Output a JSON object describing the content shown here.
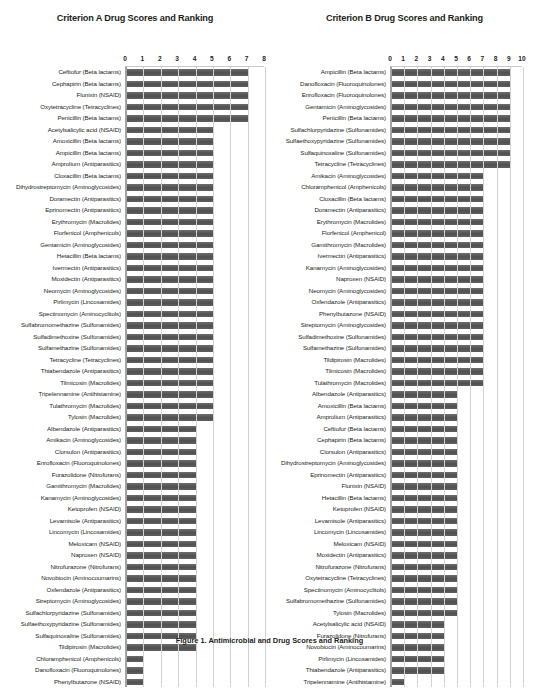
{
  "caption": "Figure 1. Antimicrobial and Drug Scores and Ranking",
  "charts": [
    {
      "id": "criterion-a",
      "chart_data": {
        "type": "bar",
        "orientation": "horizontal",
        "title": "Criterion A Drug Scores and Ranking",
        "xlabel": "",
        "ylabel": "",
        "xlim": [
          0,
          8
        ],
        "xticks": [
          0,
          1,
          2,
          3,
          4,
          5,
          6,
          7,
          8
        ],
        "grid": true,
        "legend": "none",
        "bar_color": "#595959",
        "categories": [
          "Ceftiofur (Beta lactams)",
          "Cephapirin (Beta lactams)",
          "Flunixin (NSAID)",
          "Oxytetracycline (Tetracyclines)",
          "Penicillin (Beta lactams)",
          "Acetylsalicylic acid (NSAID)",
          "Amoxicillin (Beta lactams)",
          "Ampicillin (Beta lactams)",
          "Amprolium (Antiparasitics)",
          "Cloxacillin (Beta lactams)",
          "Dihydrostreptomycin (Aminoglycosides)",
          "Doramectin (Antiparasitics)",
          "Eprinomectin (Antiparasitics)",
          "Erythromycin (Macrolides)",
          "Florfenicol (Amphenicols)",
          "Gentamicin (Aminoglycosides)",
          "Hetacillin (Beta lactams)",
          "Ivermectin (Antiparasitics)",
          "Moxidectin (Antiparasitics)",
          "Neomycin (Aminoglycosides)",
          "Pirlimycin (Lincosamides)",
          "Spectinomycin (Aminocyclitols)",
          "Sulfabromomethazine (Sulfonamides)",
          "Sulfadimethoxine (Sulfonamides)",
          "Sulfamethazine (Sulfonamides)",
          "Tetracycline (Tetracyclines)",
          "Thiabendazole (Antiparasitics)",
          "Tilmicosin (Macrolides)",
          "Tripelennamine (Antihistamine)",
          "Tulathromycin (Macrolides)",
          "Tylosin (Macrolides)",
          "Albendazole (Antiparasitics)",
          "Amikacin (Aminoglycosides)",
          "Clorsulon (Antiparasitics)",
          "Enrofloxacin (Fluoroquinolones)",
          "Furazolidone (Nitrofurans)",
          "Gamithromycin (Macrolides)",
          "Kanamycin (Aminoglycosides)",
          "Ketoprofen (NSAID)",
          "Levamisole (Antiparasitics)",
          "Lincomycin (Lincosamides)",
          "Meloxicam (NSAID)",
          "Naproxen (NSAID)",
          "Nitrofurazone (Nitrofurans)",
          "Novobiocin (Aminocoumarins)",
          "Oxfendazole (Antiparasitics)",
          "Streptomycin (Aminoglycosides)",
          "Sulfachlorpyridazine (Sulfonamides)",
          "Sulfaethoxypyridazine (Sulfonamides)",
          "Sulfaquinoxaline (Sulfonamides)",
          "Tildipirosin (Macrolides)",
          "Chloramphenicol (Amphenicols)",
          "Danofloxacin (Fluoroquinolones)",
          "Phenylbutazone (NSAID)"
        ],
        "values": [
          7,
          7,
          7,
          7,
          7,
          5,
          5,
          5,
          5,
          5,
          5,
          5,
          5,
          5,
          5,
          5,
          5,
          5,
          5,
          5,
          5,
          5,
          5,
          5,
          5,
          5,
          5,
          5,
          5,
          5,
          5,
          4,
          4,
          4,
          4,
          4,
          4,
          4,
          4,
          4,
          4,
          4,
          4,
          4,
          4,
          4,
          4,
          4,
          4,
          4,
          4,
          1,
          1,
          1
        ]
      }
    },
    {
      "id": "criterion-b",
      "chart_data": {
        "type": "bar",
        "orientation": "horizontal",
        "title": "Criterion B Drug Scores and Ranking",
        "xlabel": "",
        "ylabel": "",
        "xlim": [
          0,
          10
        ],
        "xticks": [
          0,
          1,
          2,
          3,
          4,
          5,
          6,
          7,
          8,
          9,
          10
        ],
        "grid": true,
        "legend": "none",
        "bar_color": "#595959",
        "categories": [
          "Ampicillin (Beta lactams)",
          "Danofloxacin (Fluoroquinolones)",
          "Enrofloxacin (Fluoroquinolones)",
          "Gentamicin (Aminoglycosides)",
          "Penicillin (Beta lactams)",
          "Sulfachlorpyridazine (Sulfonamides)",
          "Sulfaethoxypyridazine (Sulfonamides)",
          "Sulfaquinoxaline (Sulfonamides)",
          "Tetracycline (Tetracyclines)",
          "Amikacin (Aminoglycosides)",
          "Chloramphenicol (Amphenicols)",
          "Cloxacillin (Beta lactams)",
          "Doramectin (Antiparasitics)",
          "Erythromycin (Macrolides)",
          "Florfenicol (Amphenicol)",
          "Gamithromycin (Macrolides)",
          "Ivermectin (Antiparasitics)",
          "Kanamycin (Aminoglycosides)",
          "Naproxen (NSAID)",
          "Neomycin (Aminoglycosides)",
          "Oxfendazole (Antiparasitics)",
          "Phenylbutazone (NSAID)",
          "Streptomycin (Aminoglycosides)",
          "Sulfadimethoxine (Sulfonamides)",
          "Sulfamethazine (Sulfonamides)",
          "Tildipirosin (Macrolides)",
          "Tilmicosin (Macrolides)",
          "Tulathromycin (Macrolides)",
          "Albendazole (Antiparasitics)",
          "Amoxicillin (Beta lactams)",
          "Amprolium (Antiparasitics)",
          "Ceftiofur (Beta lactams)",
          "Cephapirin (Beta lactams)",
          "Clorsulon (Antiparasitics)",
          "Dihydrostreptomycin (Aminoglycosides)",
          "Eprinomectin (Antiparasitics)",
          "Flunixin (NSAID)",
          "Hetacillin (Beta lactams)",
          "Ketoprofen (NSAID)",
          "Levamisole (Antiparasitics)",
          "Lincomycin (Lincosamides)",
          "Meloxicam (NSAID)",
          "Moxidectin (Antiparasitics)",
          "Nitrofurazone (Nitrofurans)",
          "Oxytetracycline (Tetracyclines)",
          "Spectinomycin (Aminocyclitols)",
          "Sulfabromomethazine (Sulfonamides)",
          "Tylosin (Macrolides)",
          "Acetylsalicylic acid (NSAID)",
          "Furazolidone (Nitrofurans)",
          "Novobiocin (Aminocoumarins)",
          "Pirlimycin (Lincosamides)",
          "Thiabendazole (Antiparasitics)",
          "Tripelennamine (Antihistamine)"
        ],
        "values": [
          9,
          9,
          9,
          9,
          9,
          9,
          9,
          9,
          9,
          7,
          7,
          7,
          7,
          7,
          7,
          7,
          7,
          7,
          7,
          7,
          7,
          7,
          7,
          7,
          7,
          7,
          7,
          7,
          5,
          5,
          5,
          5,
          5,
          5,
          5,
          5,
          5,
          5,
          5,
          5,
          5,
          5,
          5,
          5,
          5,
          5,
          5,
          5,
          4,
          4,
          4,
          4,
          4,
          1
        ]
      }
    }
  ]
}
